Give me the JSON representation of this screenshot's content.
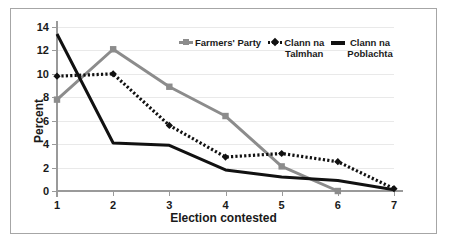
{
  "chart_data": {
    "type": "line",
    "title": "",
    "xlabel": "Election contested",
    "ylabel": "Percent",
    "x": [
      1,
      2,
      3,
      4,
      5,
      6,
      7
    ],
    "categories": [
      "1",
      "2",
      "3",
      "4",
      "5",
      "6",
      "7"
    ],
    "xlim": [
      1,
      7
    ],
    "ylim": [
      0,
      14
    ],
    "yticks": [
      0,
      2,
      4,
      6,
      8,
      10,
      12,
      14
    ],
    "ytick_labels": [
      "0",
      "2",
      "4",
      "6",
      "8",
      "10",
      "12",
      "14"
    ],
    "grid": "horizontal",
    "legend_position": "top-right",
    "series": [
      {
        "name": "Farmers' Party",
        "label": "Farmers' Party",
        "color": "#8c8c8c",
        "style": "solid",
        "marker": "square",
        "x": [
          1,
          2,
          3,
          4,
          5,
          6
        ],
        "values": [
          7.8,
          12.1,
          8.9,
          6.4,
          2.1,
          0.0
        ]
      },
      {
        "name": "Clann na Talmhan",
        "label": "Clann na\nTalmhan",
        "color": "#111111",
        "style": "dotted",
        "marker": "diamond",
        "x": [
          1,
          2,
          3,
          4,
          5,
          6,
          7
        ],
        "values": [
          9.8,
          10.0,
          5.6,
          2.9,
          3.2,
          2.5,
          0.2
        ]
      },
      {
        "name": "Clann na Poblachta",
        "label": "Clann na\nPoblachta",
        "color": "#111111",
        "style": "solid",
        "marker": "none",
        "x": [
          1,
          2,
          3,
          4,
          5,
          6,
          7
        ],
        "values": [
          13.4,
          4.1,
          3.9,
          1.8,
          1.2,
          0.9,
          0.1
        ]
      }
    ]
  },
  "colors": {
    "gray_series": "#8c8c8c",
    "black_series": "#111111",
    "gridline": "#e9e9e9",
    "axis": "#9a9a9a",
    "border": "#a6a6a6",
    "background": "#ffffff"
  }
}
